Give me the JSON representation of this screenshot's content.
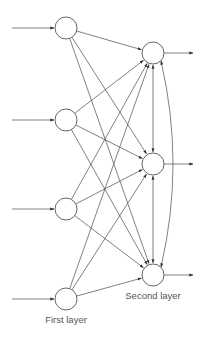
{
  "diagram": {
    "type": "neural-network",
    "colors": {
      "stroke": "#4a4a4a",
      "node_stroke": "#555555",
      "node_fill": "#ffffff",
      "label": "#555555",
      "background": "#ffffff"
    },
    "node_radius": 11,
    "first_layer": {
      "label": "First layer",
      "label_pos": [
        66,
        323
      ],
      "nodes": [
        {
          "id": "f1",
          "x": 66,
          "y": 28
        },
        {
          "id": "f2",
          "x": 66,
          "y": 120
        },
        {
          "id": "f3",
          "x": 66,
          "y": 209
        },
        {
          "id": "f4",
          "x": 66,
          "y": 299
        }
      ],
      "input_arrow_start_x": 12
    },
    "second_layer": {
      "label": "Second layer",
      "label_pos": [
        153,
        299
      ],
      "nodes": [
        {
          "id": "s1",
          "x": 153,
          "y": 53
        },
        {
          "id": "s2",
          "x": 153,
          "y": 164
        },
        {
          "id": "s3",
          "x": 153,
          "y": 275
        }
      ],
      "output_arrow_end_x": 193
    },
    "connections": "fully-connected first layer to second layer; bidirectional lateral connections s1<->s2, s2<->s3, and curved s1<->s3"
  }
}
